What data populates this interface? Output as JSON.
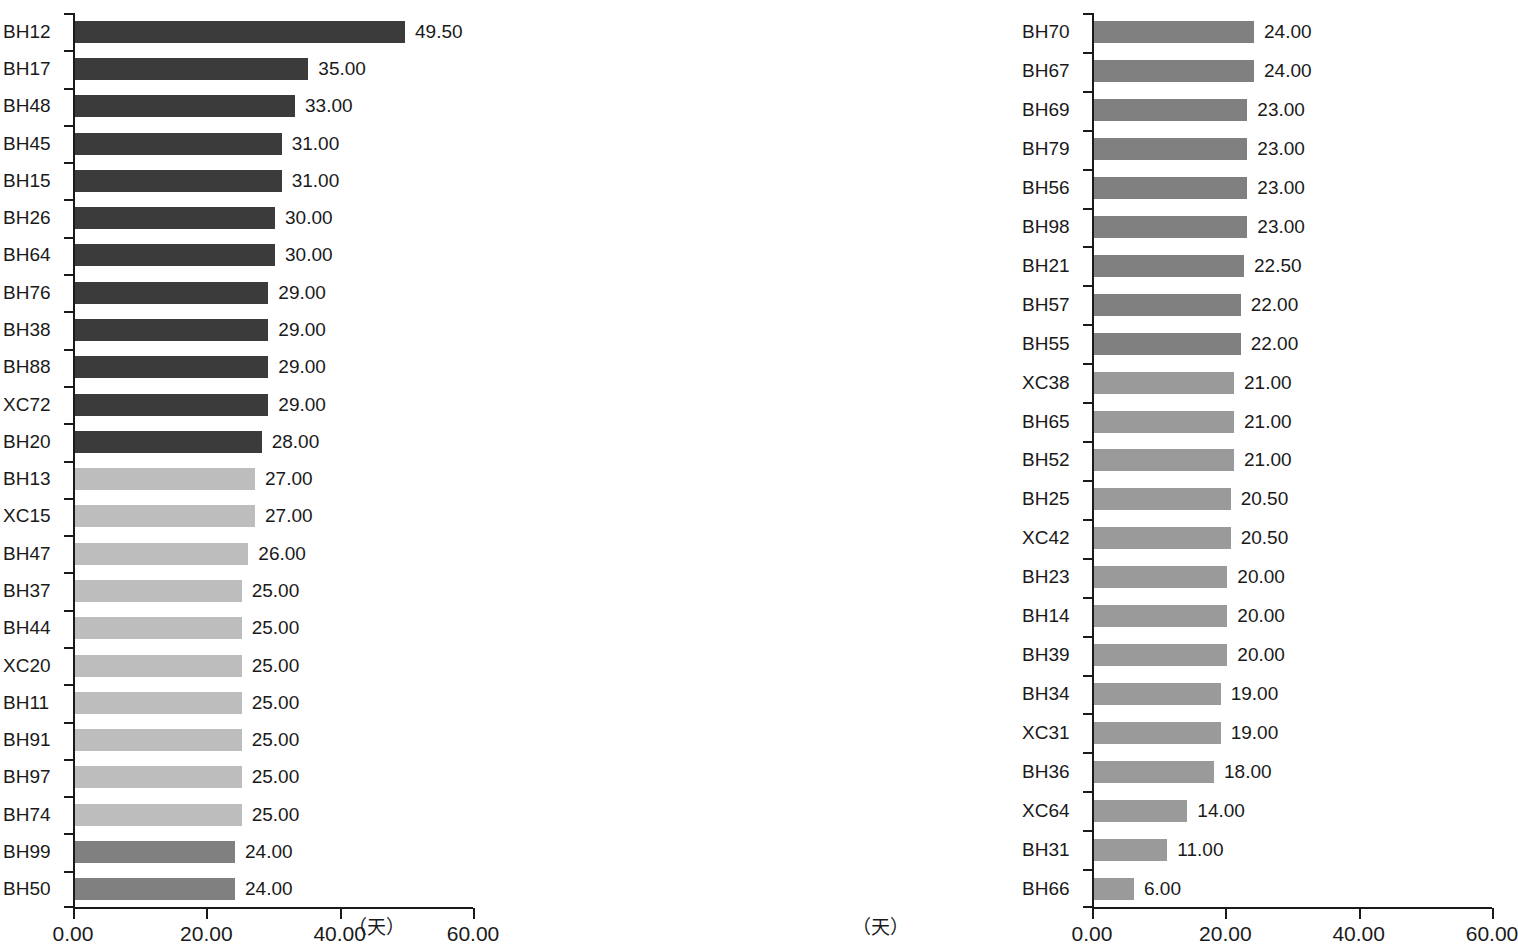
{
  "figure": {
    "background": "#ffffff",
    "unit_label": "（天）",
    "axis_color": "#1a1a1a"
  },
  "colors": {
    "dark": "#3b3b3b",
    "medium": "#808080",
    "medium_light": "#9a9a9a",
    "light": "#bdbdbd"
  },
  "chart_data": [
    {
      "type": "bar",
      "orientation": "horizontal",
      "title": "",
      "subtitle": "",
      "xlabel": "（天）",
      "ylabel": "",
      "xlim": [
        0,
        60
      ],
      "xticks": [
        0,
        20,
        40,
        60
      ],
      "xticklabels": [
        "0.00",
        "20.00",
        "40.00",
        "60.00"
      ],
      "grid": false,
      "legend": "none",
      "panel": "left",
      "categories": [
        "BH12",
        "BH17",
        "BH48",
        "BH45",
        "BH15",
        "BH26",
        "BH64",
        "BH76",
        "BH38",
        "BH88",
        "XC72",
        "BH20",
        "BH13",
        "XC15",
        "BH47",
        "BH37",
        "BH44",
        "XC20",
        "BH11",
        "BH91",
        "BH97",
        "BH74",
        "BH99",
        "BH50"
      ],
      "values": [
        49.5,
        35.0,
        33.0,
        31.0,
        31.0,
        30.0,
        30.0,
        29.0,
        29.0,
        29.0,
        29.0,
        28.0,
        27.0,
        27.0,
        26.0,
        25.0,
        25.0,
        25.0,
        25.0,
        25.0,
        25.0,
        25.0,
        24.0,
        24.0
      ],
      "labels": [
        "49.50",
        "35.00",
        "33.00",
        "31.00",
        "31.00",
        "30.00",
        "30.00",
        "29.00",
        "29.00",
        "29.00",
        "29.00",
        "28.00",
        "27.00",
        "27.00",
        "26.00",
        "25.00",
        "25.00",
        "25.00",
        "25.00",
        "25.00",
        "25.00",
        "25.00",
        "24.00",
        "24.00"
      ],
      "bar_colors": [
        "#3b3b3b",
        "#3b3b3b",
        "#3b3b3b",
        "#3b3b3b",
        "#3b3b3b",
        "#3b3b3b",
        "#3b3b3b",
        "#3b3b3b",
        "#3b3b3b",
        "#3b3b3b",
        "#3b3b3b",
        "#3b3b3b",
        "#bdbdbd",
        "#bdbdbd",
        "#bdbdbd",
        "#bdbdbd",
        "#bdbdbd",
        "#bdbdbd",
        "#bdbdbd",
        "#bdbdbd",
        "#bdbdbd",
        "#bdbdbd",
        "#808080",
        "#808080"
      ]
    },
    {
      "type": "bar",
      "orientation": "horizontal",
      "title": "",
      "subtitle": "",
      "xlabel": "（天）",
      "ylabel": "",
      "xlim": [
        0,
        60
      ],
      "xticks": [
        0,
        20,
        40,
        60
      ],
      "xticklabels": [
        "0.00",
        "20.00",
        "40.00",
        "60.00"
      ],
      "grid": false,
      "legend": "none",
      "panel": "right",
      "categories": [
        "BH70",
        "BH67",
        "BH69",
        "BH79",
        "BH56",
        "BH98",
        "BH21",
        "BH57",
        "BH55",
        "XC38",
        "BH65",
        "BH52",
        "BH25",
        "XC42",
        "BH23",
        "BH14",
        "BH39",
        "BH34",
        "XC31",
        "BH36",
        "XC64",
        "BH31",
        "BH66"
      ],
      "values": [
        24.0,
        24.0,
        23.0,
        23.0,
        23.0,
        23.0,
        22.5,
        22.0,
        22.0,
        21.0,
        21.0,
        21.0,
        20.5,
        20.5,
        20.0,
        20.0,
        20.0,
        19.0,
        19.0,
        18.0,
        14.0,
        11.0,
        6.0
      ],
      "labels": [
        "24.00",
        "24.00",
        "23.00",
        "23.00",
        "23.00",
        "23.00",
        "22.50",
        "22.00",
        "22.00",
        "21.00",
        "21.00",
        "21.00",
        "20.50",
        "20.50",
        "20.00",
        "20.00",
        "20.00",
        "19.00",
        "19.00",
        "18.00",
        "14.00",
        "11.00",
        "6.00"
      ],
      "bar_colors": [
        "#808080",
        "#808080",
        "#808080",
        "#808080",
        "#808080",
        "#808080",
        "#808080",
        "#808080",
        "#808080",
        "#9a9a9a",
        "#9a9a9a",
        "#9a9a9a",
        "#9a9a9a",
        "#9a9a9a",
        "#9a9a9a",
        "#9a9a9a",
        "#9a9a9a",
        "#9a9a9a",
        "#9a9a9a",
        "#9a9a9a",
        "#9a9a9a",
        "#9a9a9a",
        "#9a9a9a"
      ]
    }
  ]
}
